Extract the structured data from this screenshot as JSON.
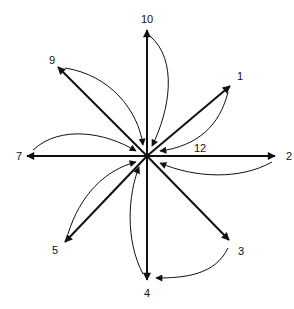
{
  "diagram": {
    "type": "radial-arrow-diagram",
    "center": {
      "x": 147,
      "y": 156
    },
    "colors": {
      "stroke": "#111111",
      "background": "#ffffff"
    },
    "spokes": [
      {
        "id": "10",
        "label": "10",
        "tip": [
          147,
          30
        ],
        "label_pos": [
          147,
          23
        ]
      },
      {
        "id": "1",
        "label": "1",
        "tip": [
          230,
          86
        ],
        "label_pos": [
          240,
          80
        ]
      },
      {
        "id": "2",
        "label": "2",
        "tip": [
          275,
          156
        ],
        "label_pos": [
          289,
          160
        ]
      },
      {
        "id": "3",
        "label": "3",
        "tip": [
          229,
          240
        ],
        "label_pos": [
          241,
          255
        ]
      },
      {
        "id": "4",
        "label": "4",
        "tip": [
          147,
          280
        ],
        "label_pos": [
          147,
          297
        ]
      },
      {
        "id": "5",
        "label": "5",
        "tip": [
          65,
          242
        ],
        "label_pos": [
          55,
          254
        ]
      },
      {
        "id": "7",
        "label": "7",
        "tip": [
          27,
          156
        ],
        "label_pos": [
          19,
          160
        ]
      },
      {
        "id": "9",
        "label": "9",
        "tip": [
          58,
          67
        ],
        "label_pos": [
          52,
          64
        ]
      }
    ],
    "center_label": {
      "label": "12",
      "pos": [
        200,
        152
      ]
    },
    "curves": [
      {
        "from": "10",
        "to": "center",
        "d": "M150,36 C178,60 170,110 152,146"
      },
      {
        "from": "1",
        "to": "center",
        "d": "M228,92 C220,125 198,146 160,151"
      },
      {
        "from": "2",
        "to": "center",
        "d": "M272,162 C240,180 195,178 160,163"
      },
      {
        "from": "3",
        "to": "4",
        "d": "M228,248 C215,275 185,278 156,278"
      },
      {
        "from": "4",
        "to": "center",
        "d": "M143,274 C125,240 128,195 139,167"
      },
      {
        "from": "5",
        "to": "center",
        "d": "M68,234 C80,195 105,170 136,162"
      },
      {
        "from": "7",
        "to": "center",
        "d": "M33,150 C60,125 105,132 136,151"
      },
      {
        "from": "9",
        "to": "center",
        "d": "M65,68 C110,75 138,110 143,145"
      }
    ]
  }
}
